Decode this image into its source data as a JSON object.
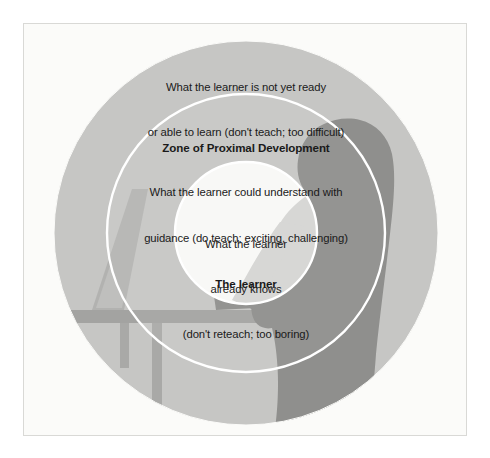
{
  "diagram": {
    "title_semantic": "zone-of-proximal-development-diagram",
    "frame": {
      "background": "#fbfbf9",
      "border_color": "#d9d9d6"
    },
    "colors": {
      "outer_ring": "#c6c6c4",
      "middle_ring": "#c9c9c7",
      "inner_circle": "#f8f8f6",
      "divider_stroke": "#ffffff",
      "silhouette_light": "#b2b2b0",
      "silhouette_dark": "#8f8f8d",
      "silhouette_darkest": "#7e7e7c",
      "text": "#1a1a1a",
      "page_background": "#ffffff"
    },
    "rings": [
      {
        "name": "outer-ring",
        "lines": [
          "What the learner is not yet ready",
          "or able to learn (don't teach; too difficult)"
        ]
      },
      {
        "name": "middle-ring",
        "heading": "Zone of Proximal Development",
        "lines": [
          "What the learner could understand with",
          "guidance (do teach; exciting, challenging)"
        ]
      },
      {
        "name": "inner-circle",
        "lines": [
          "What the learner",
          "already knows",
          "(don't reteach; too boring)"
        ]
      }
    ],
    "caption": "The learner",
    "illustration": {
      "name": "person-at-computer-silhouette",
      "elements": [
        "person-silhouette",
        "monitor",
        "desk",
        "keyboard",
        "chair"
      ]
    }
  }
}
